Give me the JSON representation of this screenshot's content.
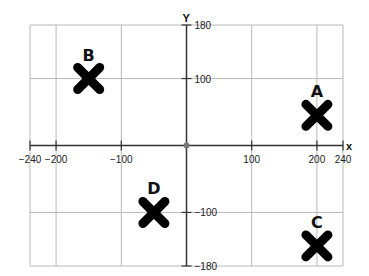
{
  "chart_data": {
    "type": "scatter",
    "title": "",
    "xlabel": "x",
    "ylabel": "y",
    "xlim": [
      -240,
      240
    ],
    "ylim": [
      -180,
      180
    ],
    "grid": true,
    "x_ticks": [
      -240,
      -200,
      -100,
      100,
      200,
      240
    ],
    "y_ticks": [
      180,
      100,
      -100,
      -180
    ],
    "x_grid": [
      -240,
      -200,
      -100,
      100,
      200,
      240
    ],
    "y_grid": [
      180,
      100,
      -100,
      -180
    ],
    "marker": "X",
    "points": [
      {
        "label": "A",
        "x": 200,
        "y": 45
      },
      {
        "label": "B",
        "x": -150,
        "y": 100
      },
      {
        "label": "C",
        "x": 200,
        "y": -150
      },
      {
        "label": "D",
        "x": -50,
        "y": -100
      }
    ],
    "colors": {
      "grid": "#b8b8b8",
      "axis": "#333333",
      "marker": "#000000"
    }
  }
}
